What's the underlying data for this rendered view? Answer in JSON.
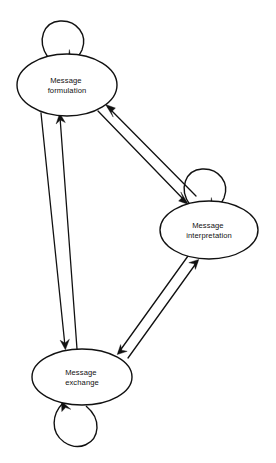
{
  "diagram": {
    "background_color": "#ffffff",
    "stroke_color": "#111111",
    "nodes": [
      {
        "id": "message-formulation",
        "label_line1": "Message",
        "label_line2": "formulation",
        "cx": 67,
        "cy": 85,
        "rx": 50,
        "ry": 31,
        "self_loop": "above",
        "self_loop_label": "self-transition"
      },
      {
        "id": "message-interpretation",
        "label_line1": "Message",
        "label_line2": "interpretation",
        "cx": 209,
        "cy": 230,
        "rx": 49,
        "ry": 29,
        "self_loop": "above",
        "self_loop_label": "self-transition"
      },
      {
        "id": "message-exchange",
        "label_line1": "Message",
        "label_line2": "exchange",
        "cx": 82,
        "cy": 377,
        "rx": 50,
        "ry": 28,
        "self_loop": "below",
        "self_loop_label": "self-transition"
      }
    ],
    "edges": [
      {
        "id": "formulation-to-interpretation",
        "from": "message-formulation",
        "to": "message-interpretation",
        "direction": "down-right"
      },
      {
        "id": "interpretation-to-formulation",
        "from": "message-interpretation",
        "to": "message-formulation",
        "direction": "up-left"
      },
      {
        "id": "formulation-to-exchange",
        "from": "message-formulation",
        "to": "message-exchange",
        "direction": "down"
      },
      {
        "id": "exchange-to-formulation",
        "from": "message-exchange",
        "to": "message-formulation",
        "direction": "up"
      },
      {
        "id": "interpretation-to-exchange",
        "from": "message-interpretation",
        "to": "message-exchange",
        "direction": "down-left"
      },
      {
        "id": "exchange-to-interpretation",
        "from": "message-exchange",
        "to": "message-interpretation",
        "direction": "up-right"
      }
    ]
  }
}
